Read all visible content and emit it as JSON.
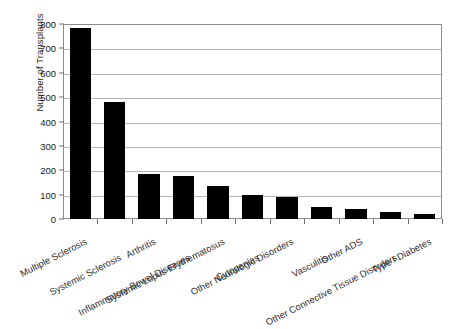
{
  "chart_data": {
    "type": "bar",
    "title": "",
    "xlabel": "",
    "ylabel": "Number of Transplants",
    "ylim": [
      0,
      800
    ],
    "yticks": [
      0,
      100,
      200,
      300,
      400,
      500,
      600,
      700,
      800
    ],
    "ytick_labels": [
      "0",
      "100",
      "200",
      "300",
      "400",
      "500",
      "600",
      "700",
      "800"
    ],
    "grid": true,
    "legend": null,
    "bar_color": "#000000",
    "gridline_color": "#b3b3b3",
    "axis_color": "#8c8c8c",
    "background": "#ffffff",
    "categories": [
      "Multiple Sclerosis",
      "Systemic Sclerosis",
      "Arthritis",
      "Inflammatory Bowel Diseases",
      "Systemic Lupus Erythematosus",
      "Cytopenias",
      "Other Neurologic Disorders",
      "Vasculitis",
      "Other ADS",
      "Other Connective Tissue Disorders",
      "Type I Diabetes"
    ],
    "values": [
      785,
      480,
      185,
      175,
      135,
      100,
      90,
      50,
      42,
      30,
      20
    ]
  }
}
